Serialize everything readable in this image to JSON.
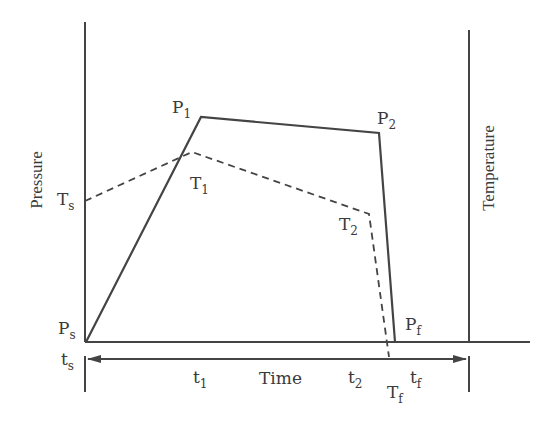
{
  "diagram": {
    "left_axis_label": "Pressure",
    "right_axis_label": "Temperature",
    "time_label": "Time",
    "colors": {
      "line": "#444444",
      "text": "#3a3a3a",
      "background": "#ffffff"
    },
    "pressure_curve": {
      "style": "solid",
      "points": [
        {
          "id": "Ps",
          "main": "P",
          "sub": "s"
        },
        {
          "id": "P1",
          "main": "P",
          "sub": "1"
        },
        {
          "id": "P2",
          "main": "P",
          "sub": "2"
        },
        {
          "id": "Pf",
          "main": "P",
          "sub": "f"
        }
      ]
    },
    "temperature_curve": {
      "style": "dashed",
      "points": [
        {
          "id": "Ts",
          "main": "T",
          "sub": "s"
        },
        {
          "id": "T1",
          "main": "T",
          "sub": "1"
        },
        {
          "id": "T2",
          "main": "T",
          "sub": "2"
        },
        {
          "id": "Tf",
          "main": "T",
          "sub": "f"
        }
      ]
    },
    "time_marks": [
      {
        "id": "ts",
        "main": "t",
        "sub": "s"
      },
      {
        "id": "t1",
        "main": "t",
        "sub": "1"
      },
      {
        "id": "t2",
        "main": "t",
        "sub": "2"
      },
      {
        "id": "tf",
        "main": "t",
        "sub": "f"
      }
    ]
  }
}
